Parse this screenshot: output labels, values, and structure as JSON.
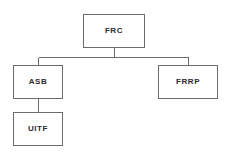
{
  "diagram": {
    "type": "hierarchy-tree",
    "orientation": "top-down",
    "background_color": "#ffffff",
    "edge_color": "#6b6b6b",
    "node_border_color": "#6b6b6b",
    "node_fill_color": "#ffffff",
    "label_color": "#2b2b2b",
    "nodes": [
      {
        "id": "frc",
        "label": "FRC",
        "level": 0,
        "x": 83,
        "y": 14,
        "width": 62,
        "height": 34
      },
      {
        "id": "asb",
        "label": "ASB",
        "level": 1,
        "x": 13,
        "y": 65,
        "width": 50,
        "height": 34
      },
      {
        "id": "frrp",
        "label": "FRRP",
        "level": 1,
        "x": 158,
        "y": 65,
        "width": 60,
        "height": 34
      },
      {
        "id": "uitf",
        "label": "UITF",
        "level": 2,
        "x": 13,
        "y": 112,
        "width": 50,
        "height": 34
      }
    ],
    "edges": [
      {
        "from": "frc",
        "to": "asb",
        "style": "orthogonal"
      },
      {
        "from": "frc",
        "to": "frrp",
        "style": "orthogonal"
      },
      {
        "from": "asb",
        "to": "uitf",
        "style": "straight"
      }
    ]
  }
}
